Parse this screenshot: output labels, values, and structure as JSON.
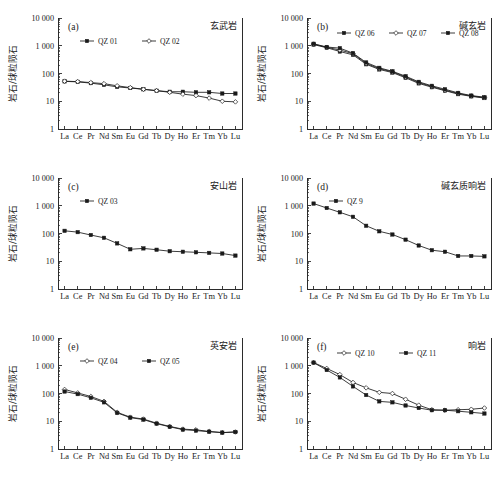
{
  "figure": {
    "axis": {
      "y_label": "岩石/球粒陨石",
      "y_ticks": [
        "10 000",
        "1 000",
        "100",
        "10",
        "1"
      ],
      "y_tick_values": [
        10000,
        1000,
        100,
        10,
        1
      ],
      "x_ticks": [
        "La",
        "Ce",
        "Pr",
        "Nd",
        "Sm",
        "Eu",
        "Gd",
        "Tb",
        "Dy",
        "Ho",
        "Er",
        "Tm",
        "Yb",
        "Lu"
      ],
      "y_scale": "log",
      "ylim": [
        1,
        10000
      ]
    }
  },
  "chart_data": [
    {
      "type": "line",
      "panel": "(a)",
      "title": "玄武岩",
      "xlabel": "",
      "ylabel": "岩石/球粒陨石",
      "categories": [
        "La",
        "Ce",
        "Pr",
        "Nd",
        "Sm",
        "Eu",
        "Gd",
        "Tb",
        "Dy",
        "Ho",
        "Er",
        "Tm",
        "Yb",
        "Lu"
      ],
      "ylim": [
        1,
        10000
      ],
      "yscale": "log",
      "grid": false,
      "legend_position": "top-left",
      "series": [
        {
          "name": "QZ 01",
          "marker": "filled-square",
          "values": [
            52,
            50,
            45,
            39,
            33,
            30,
            27,
            24,
            22,
            22,
            21,
            21,
            19,
            19
          ]
        },
        {
          "name": "QZ 02",
          "marker": "open-diamond",
          "values": [
            53,
            51,
            47,
            43,
            36,
            31,
            27,
            24,
            21,
            18,
            16,
            13,
            10,
            9.5
          ]
        }
      ]
    },
    {
      "type": "line",
      "panel": "(b)",
      "title": "碱玄岩",
      "xlabel": "",
      "ylabel": "岩石/球粒陨石",
      "categories": [
        "La",
        "Ce",
        "Pr",
        "Nd",
        "Sm",
        "Eu",
        "Gd",
        "Tb",
        "Dy",
        "Ho",
        "Er",
        "Tm",
        "Yb",
        "Lu"
      ],
      "ylim": [
        1,
        10000
      ],
      "yscale": "log",
      "grid": false,
      "legend_position": "top-center",
      "series": [
        {
          "name": "QZ 06",
          "marker": "filled-square",
          "values": [
            1100,
            850,
            620,
            470,
            215,
            140,
            108,
            70,
            44,
            32,
            24,
            18,
            15,
            13
          ]
        },
        {
          "name": "QZ 07",
          "marker": "open-diamond",
          "values": [
            1150,
            880,
            700,
            520,
            230,
            150,
            115,
            75,
            47,
            34,
            25,
            19,
            15.5,
            13.5
          ]
        },
        {
          "name": "QZ 08",
          "marker": "filled-square",
          "values": [
            1180,
            900,
            820,
            540,
            250,
            160,
            120,
            80,
            50,
            36,
            27,
            20,
            16,
            14
          ]
        }
      ]
    },
    {
      "type": "line",
      "panel": "(c)",
      "title": "安山岩",
      "xlabel": "",
      "ylabel": "岩石/球粒陨石",
      "categories": [
        "La",
        "Ce",
        "Pr",
        "Nd",
        "Sm",
        "Eu",
        "Gd",
        "Tb",
        "Dy",
        "Ho",
        "Er",
        "Tm",
        "Yb",
        "Lu"
      ],
      "ylim": [
        1,
        10000
      ],
      "yscale": "log",
      "grid": false,
      "legend_position": "top-left",
      "series": [
        {
          "name": "QZ 03",
          "marker": "filled-square",
          "values": [
            125,
            112,
            88,
            70,
            44,
            27,
            29,
            26,
            23,
            22,
            21,
            20,
            19,
            16
          ]
        }
      ]
    },
    {
      "type": "line",
      "panel": "(d)",
      "title": "碱玄质响岩",
      "xlabel": "",
      "ylabel": "岩石/球粒陨石",
      "categories": [
        "La",
        "Ce",
        "Pr",
        "Nd",
        "Sm",
        "Eu",
        "Gd",
        "Tb",
        "Dy",
        "Ho",
        "Er",
        "Tm",
        "Yb",
        "Lu"
      ],
      "ylim": [
        1,
        10000
      ],
      "yscale": "log",
      "grid": false,
      "legend_position": "top-left",
      "series": [
        {
          "name": "QZ 9",
          "marker": "filled-square",
          "values": [
            1200,
            830,
            580,
            400,
            190,
            120,
            92,
            60,
            37,
            25,
            22,
            15.5,
            15.5,
            15
          ]
        }
      ]
    },
    {
      "type": "line",
      "panel": "(e)",
      "title": "英安岩",
      "xlabel": "",
      "ylabel": "岩石/球粒陨石",
      "categories": [
        "La",
        "Ce",
        "Pr",
        "Nd",
        "Sm",
        "Eu",
        "Gd",
        "Tb",
        "Dy",
        "Ho",
        "Er",
        "Tm",
        "Yb",
        "Lu"
      ],
      "ylim": [
        1,
        10000
      ],
      "yscale": "log",
      "grid": false,
      "legend_position": "top-left",
      "series": [
        {
          "name": "QZ 04",
          "marker": "open-diamond",
          "values": [
            140,
            105,
            78,
            52,
            21,
            14,
            12,
            8.5,
            6.5,
            5.2,
            4.9,
            4.3,
            3.9,
            4.1
          ]
        },
        {
          "name": "QZ 05",
          "marker": "filled-square",
          "values": [
            118,
            95,
            70,
            48,
            20,
            13.5,
            11.5,
            8.2,
            6.3,
            5.0,
            4.6,
            4.2,
            3.9,
            4.1
          ]
        }
      ]
    },
    {
      "type": "line",
      "panel": "(f)",
      "title": "响岩",
      "xlabel": "",
      "ylabel": "岩石/球粒陨石",
      "categories": [
        "La",
        "Ce",
        "Pr",
        "Nd",
        "Sm",
        "Eu",
        "Gd",
        "Tb",
        "Dy",
        "Ho",
        "Er",
        "Tm",
        "Yb",
        "Lu"
      ],
      "ylim": [
        1,
        10000
      ],
      "yscale": "log",
      "grid": false,
      "legend_position": "top-center",
      "series": [
        {
          "name": "QZ 10",
          "marker": "open-diamond",
          "values": [
            1300,
            800,
            480,
            250,
            160,
            110,
            100,
            62,
            38,
            26,
            25,
            26,
            27,
            30
          ]
        },
        {
          "name": "QZ 11",
          "marker": "filled-square",
          "values": [
            1300,
            700,
            380,
            180,
            88,
            52,
            48,
            37,
            30,
            25,
            25,
            23,
            21,
            19
          ]
        }
      ]
    }
  ]
}
